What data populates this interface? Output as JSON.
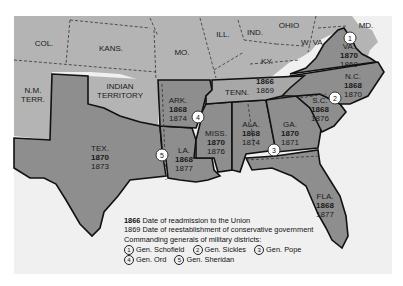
{
  "map": {
    "title": "Reconstruction in the South",
    "colors": {
      "background": "#ffffff",
      "frame": "#f0f0f0",
      "union_states": "#b4b4b4",
      "confederate_states": "#8e8e8e",
      "tennessee": "#a8a8a8",
      "water": "#efefef",
      "border": "#111111"
    },
    "regions": [
      {
        "id": "col",
        "label": "COL.",
        "confederate": false
      },
      {
        "id": "kans",
        "label": "KANS.",
        "confederate": false
      },
      {
        "id": "mo",
        "label": "MO.",
        "confederate": false
      },
      {
        "id": "ill",
        "label": "ILL.",
        "confederate": false
      },
      {
        "id": "ind",
        "label": "IND.",
        "confederate": false
      },
      {
        "id": "ohio",
        "label": "OHIO",
        "confederate": false
      },
      {
        "id": "md",
        "label": "MD.",
        "confederate": false
      },
      {
        "id": "wva",
        "label": "W. VA.",
        "confederate": false
      },
      {
        "id": "ky",
        "label": "KY.",
        "confederate": false
      },
      {
        "id": "nm",
        "label": "N.M.",
        "label2": "TERR.",
        "confederate": false
      },
      {
        "id": "indian",
        "label": "INDIAN",
        "label2": "TERRITORY",
        "confederate": false
      }
    ],
    "states": [
      {
        "id": "va",
        "label": "VA.",
        "readmitted": "1870",
        "conservative": "1869"
      },
      {
        "id": "nc",
        "label": "N.C.",
        "readmitted": "1868",
        "conservative": "1870"
      },
      {
        "id": "sc",
        "label": "S.C.",
        "readmitted": "1868",
        "conservative": "1876"
      },
      {
        "id": "tenn",
        "label": "TENN.",
        "readmitted": "1866",
        "conservative": "1869"
      },
      {
        "id": "ark",
        "label": "ARK.",
        "readmitted": "1868",
        "conservative": "1874"
      },
      {
        "id": "miss",
        "label": "MISS.",
        "readmitted": "1870",
        "conservative": "1876"
      },
      {
        "id": "ala",
        "label": "ALA.",
        "readmitted": "1868",
        "conservative": "1874"
      },
      {
        "id": "ga",
        "label": "GA.",
        "readmitted": "1870",
        "conservative": "1871"
      },
      {
        "id": "tex",
        "label": "TEX.",
        "readmitted": "1870",
        "conservative": "1873"
      },
      {
        "id": "la",
        "label": "LA.",
        "readmitted": "1868",
        "conservative": "1877"
      },
      {
        "id": "fla",
        "label": "FLA.",
        "readmitted": "1868",
        "conservative": "1877"
      }
    ],
    "district_markers": [
      {
        "num": "1"
      },
      {
        "num": "2"
      },
      {
        "num": "3"
      },
      {
        "num": "4"
      },
      {
        "num": "5"
      }
    ]
  },
  "legend": {
    "line1_year": "1866",
    "line1_text": " Date of readmission to the Union",
    "line2_year": "1869",
    "line2_text": " Date of reestablishment of conservative government",
    "line3": "Commanding generals of military districts:",
    "generals": [
      {
        "num": "1",
        "name": "Gen. Schofield"
      },
      {
        "num": "2",
        "name": "Gen. Sickles"
      },
      {
        "num": "3",
        "name": "Gen. Pope"
      },
      {
        "num": "4",
        "name": "Gen. Ord"
      },
      {
        "num": "5",
        "name": "Gen. Sheridan"
      }
    ]
  }
}
